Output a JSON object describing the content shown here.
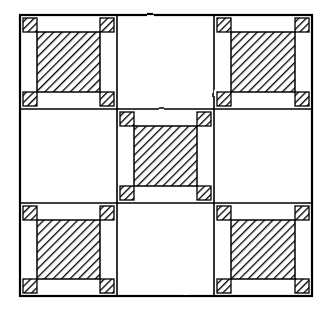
{
  "figure": {
    "kind": "technical-line-drawing",
    "style": "hand-drawn / freehand ink",
    "background_color": "#ffffff",
    "ink_color": "#000000",
    "canvas": {
      "width": 333,
      "height": 315
    }
  },
  "grid": {
    "rows": 3,
    "columns": 3,
    "origin_x": 20,
    "origin_y": 15,
    "cell_width": 97,
    "cell_height": 94,
    "column_edges": [
      20,
      117,
      214,
      312
    ],
    "row_edges": [
      15,
      109,
      203,
      296
    ],
    "outer_line_width": 2.2,
    "inner_line_width": 1.6
  },
  "cells": [
    {
      "row": 0,
      "col": 0,
      "fill": "hatched",
      "label": "cell-r0-c0"
    },
    {
      "row": 0,
      "col": 1,
      "fill": "blank",
      "label": "cell-r0-c1"
    },
    {
      "row": 0,
      "col": 2,
      "fill": "hatched",
      "label": "cell-r0-c2"
    },
    {
      "row": 1,
      "col": 0,
      "fill": "blank",
      "label": "cell-r1-c0"
    },
    {
      "row": 1,
      "col": 1,
      "fill": "hatched",
      "label": "cell-r1-c1"
    },
    {
      "row": 1,
      "col": 2,
      "fill": "blank",
      "label": "cell-r1-c2"
    },
    {
      "row": 2,
      "col": 0,
      "fill": "hatched",
      "label": "cell-r2-c0"
    },
    {
      "row": 2,
      "col": 1,
      "fill": "blank",
      "label": "cell-r2-c1"
    },
    {
      "row": 2,
      "col": 2,
      "fill": "hatched",
      "label": "cell-r2-c2"
    }
  ],
  "hatch": {
    "pattern_name": "diagonal-hatch",
    "angle_degrees": 45,
    "direction": "descending-left-to-right",
    "line_spacing_px": 4.2,
    "line_width_px": 1.5,
    "color": "#000000"
  },
  "cell_detail": {
    "frame_inset": 0,
    "corner_square_size": 14,
    "corner_square_inset": 3,
    "inner_square_inset": 17,
    "corner_squares_per_cell": 4,
    "description": "Each hatched cell shows a thin outer frame, four small hatched squares tucked into the frame corners, and one large hatched square filling the middle."
  },
  "counts": {
    "total_cells": 9,
    "hatched_cells": 5,
    "blank_cells": 4,
    "corner_squares_total": 20
  }
}
